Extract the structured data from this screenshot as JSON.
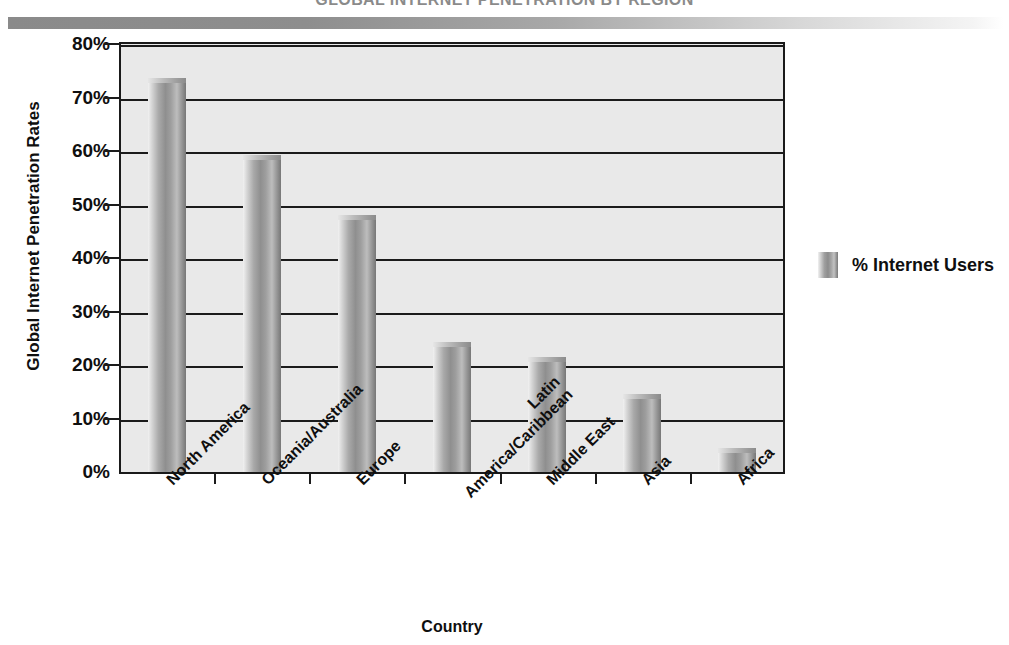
{
  "page": {
    "title": "GLOBAL INTERNET PENETRATION BY REGION",
    "rule_color": "#8a8a8a"
  },
  "legend": {
    "label": "% Internet Users",
    "swatch_color": "#8f8f8f",
    "position": "right"
  },
  "chart_data": {
    "type": "bar",
    "title": "GLOBAL INTERNET PENETRATION BY REGION",
    "xlabel": "Country",
    "ylabel": "Global Internet Penetration Rates",
    "categories": [
      "North America",
      "Oceania/Australia",
      "Europe",
      "Latin America/Caribbean",
      "Middle East",
      "Asia",
      "Africa"
    ],
    "category_lines": [
      [
        "North America"
      ],
      [
        "Oceania/Australia"
      ],
      [
        "Europe"
      ],
      [
        "Latin",
        "America/Caribbean"
      ],
      [
        "Middle East"
      ],
      [
        "Asia"
      ],
      [
        "Africa"
      ]
    ],
    "series": [
      {
        "name": "% Internet Users",
        "values": [
          73.6,
          59.2,
          48.1,
          24.3,
          21.5,
          14.6,
          4.5
        ]
      }
    ],
    "ylim": [
      0,
      80
    ],
    "ytick_values": [
      0,
      10,
      20,
      30,
      40,
      50,
      60,
      70,
      80
    ],
    "ytick_labels": [
      "0%",
      "10%",
      "20%",
      "30%",
      "40%",
      "50%",
      "60%",
      "70%",
      "80%"
    ],
    "grid": true,
    "grid_axis": "y",
    "legend_position": "right",
    "bar_color": "#8f8f8f",
    "plot_background": "#e9e9e9"
  }
}
